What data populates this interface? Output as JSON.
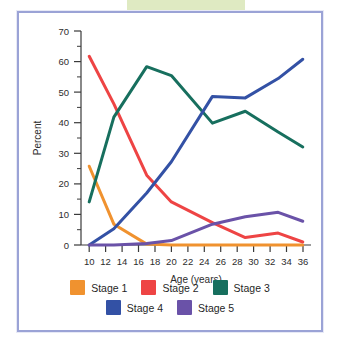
{
  "caption": {
    "truncated_text": "et al., 1988.)",
    "banner_color": "#dfeac2"
  },
  "frame": {
    "border_color": "#9ba3d6",
    "background": "#ffffff"
  },
  "chart_data": {
    "type": "line",
    "title": "",
    "xlabel": "Age (years)",
    "ylabel": "Percent",
    "xlim": [
      9,
      37
    ],
    "ylim": [
      0,
      72
    ],
    "xticks": [
      10,
      12,
      14,
      16,
      18,
      20,
      22,
      24,
      26,
      28,
      30,
      32,
      34,
      36
    ],
    "xtick_labels": [
      "10",
      "12",
      "14",
      "16",
      "18",
      "20",
      "22",
      "24",
      "26",
      "28",
      "30",
      "32",
      "34",
      "36"
    ],
    "yticks": [
      0,
      10,
      20,
      30,
      40,
      50,
      60,
      70
    ],
    "ytick_labels": [
      "0",
      "10",
      "20",
      "30",
      "40",
      "50",
      "60",
      "70"
    ],
    "y_minor_ticks": [
      5,
      15,
      25,
      35,
      45,
      55,
      65
    ],
    "grid": false,
    "legend_position": "bottom",
    "x": [
      10,
      13,
      17,
      20,
      25,
      29,
      33,
      36
    ],
    "series": [
      {
        "name": "Stage 1",
        "color": "#f0922f",
        "x": [
          10,
          13,
          17,
          20,
          25,
          29,
          33,
          36
        ],
        "values": [
          26.5,
          7.0,
          0.3,
          0.0,
          0.0,
          0.0,
          0.0,
          0.0
        ]
      },
      {
        "name": "Stage 2",
        "color": "#ee4444",
        "x": [
          10,
          13,
          17,
          20,
          25,
          29,
          33,
          36
        ],
        "values": [
          63.5,
          47.5,
          23.5,
          14.5,
          7.5,
          2.5,
          4.0,
          1.0
        ]
      },
      {
        "name": "Stage 3",
        "color": "#176f5e",
        "x": [
          10,
          13,
          17,
          20,
          25,
          29,
          33,
          36
        ],
        "values": [
          14.5,
          43.0,
          60.0,
          57.0,
          41.0,
          45.0,
          38.0,
          33.0
        ]
      },
      {
        "name": "Stage 4",
        "color": "#3351a5",
        "x": [
          10,
          13,
          17,
          20,
          25,
          29,
          33,
          36
        ],
        "values": [
          0.0,
          5.5,
          17.5,
          28.0,
          50.0,
          49.5,
          56.0,
          62.5
        ]
      },
      {
        "name": "Stage 5",
        "color": "#6a52a8",
        "x": [
          10,
          13,
          17,
          20,
          25,
          29,
          33,
          36
        ],
        "values": [
          0.0,
          0.0,
          0.5,
          1.5,
          7.0,
          9.5,
          11.0,
          8.0
        ]
      }
    ],
    "legend": [
      {
        "label": "Stage 1",
        "color": "#f0922f"
      },
      {
        "label": "Stage 2",
        "color": "#ee4444"
      },
      {
        "label": "Stage 3",
        "color": "#176f5e"
      },
      {
        "label": "Stage 4",
        "color": "#3351a5"
      },
      {
        "label": "Stage 5",
        "color": "#6a52a8"
      }
    ],
    "legend_rows": [
      [
        "Stage 1",
        "Stage 2",
        "Stage 3"
      ],
      [
        "Stage 4",
        "Stage 5"
      ]
    ]
  }
}
